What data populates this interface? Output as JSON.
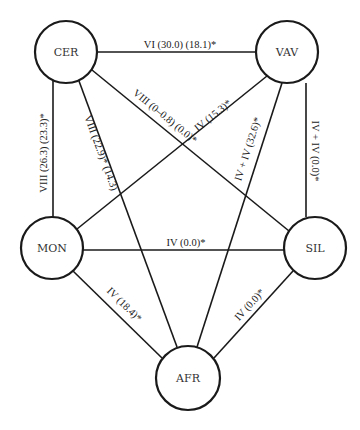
{
  "diagram": {
    "type": "network",
    "nodes": [
      {
        "id": "CER",
        "label": "CER",
        "cx": 66,
        "cy": 52,
        "r": 31
      },
      {
        "id": "VAV",
        "label": "VAV",
        "cx": 287,
        "cy": 52,
        "r": 31
      },
      {
        "id": "MON",
        "label": "MON",
        "cx": 52,
        "cy": 248,
        "r": 31
      },
      {
        "id": "SIL",
        "label": "SIL",
        "cx": 315,
        "cy": 248,
        "r": 31
      },
      {
        "id": "AFR",
        "label": "AFR",
        "cx": 188,
        "cy": 378,
        "r": 32
      }
    ],
    "edges": [
      {
        "from": "CER",
        "to": "VAV",
        "label": "VI (30.0) (18.1)*"
      },
      {
        "from": "CER",
        "to": "SIL",
        "label": "VIII (0–0.8) (0.0)*"
      },
      {
        "from": "CER",
        "to": "MON",
        "label": "VIII (26.3) (23.3)*"
      },
      {
        "from": "CER",
        "to": "AFR",
        "label": "VIII (22.9)* (14.3)"
      },
      {
        "from": "VAV",
        "to": "MON",
        "label": "IV (15.3)*"
      },
      {
        "from": "VAV",
        "to": "AFR",
        "label": "IV + IV (32.6)*"
      },
      {
        "from": "VAV",
        "to": "SIL",
        "label": "IV + IV (0.0)*"
      },
      {
        "from": "MON",
        "to": "SIL",
        "label": "IV (0.0)*"
      },
      {
        "from": "MON",
        "to": "AFR",
        "label": "IV (18.4)*"
      },
      {
        "from": "SIL",
        "to": "AFR",
        "label": "IV (0.0)*"
      }
    ]
  }
}
